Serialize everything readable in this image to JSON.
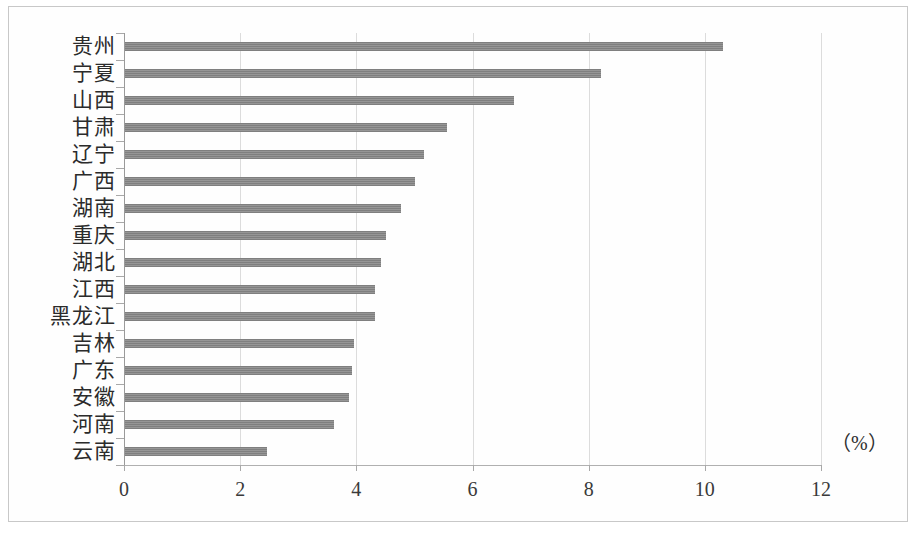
{
  "chart_data": {
    "type": "bar",
    "orientation": "horizontal",
    "title": "",
    "subtitle": "",
    "xlabel": "",
    "ylabel": "",
    "unit_annotation": "（%）",
    "xlim": [
      0,
      12
    ],
    "xticks": [
      0,
      2,
      4,
      6,
      8,
      10,
      12
    ],
    "xtick_labels": [
      "0",
      "2",
      "4",
      "6",
      "8",
      "10",
      "12"
    ],
    "grid": "vertical",
    "legend": "none",
    "bar_color": "#8a8a8a",
    "categories": [
      "贵州",
      "宁夏",
      "山西",
      "甘肃",
      "辽宁",
      "广西",
      "湖南",
      "重庆",
      "湖北",
      "江西",
      "黑龙江",
      "吉林",
      "广东",
      "安徽",
      "河南",
      "云南"
    ],
    "values": [
      10.3,
      8.2,
      6.7,
      5.55,
      5.15,
      5.0,
      4.75,
      4.5,
      4.4,
      4.3,
      4.3,
      3.95,
      3.9,
      3.85,
      3.6,
      2.45
    ],
    "series": [
      {
        "name": "",
        "values": [
          10.3,
          8.2,
          6.7,
          5.55,
          5.15,
          5.0,
          4.75,
          4.5,
          4.4,
          4.3,
          4.3,
          3.95,
          3.9,
          3.85,
          3.6,
          2.45
        ]
      }
    ]
  }
}
